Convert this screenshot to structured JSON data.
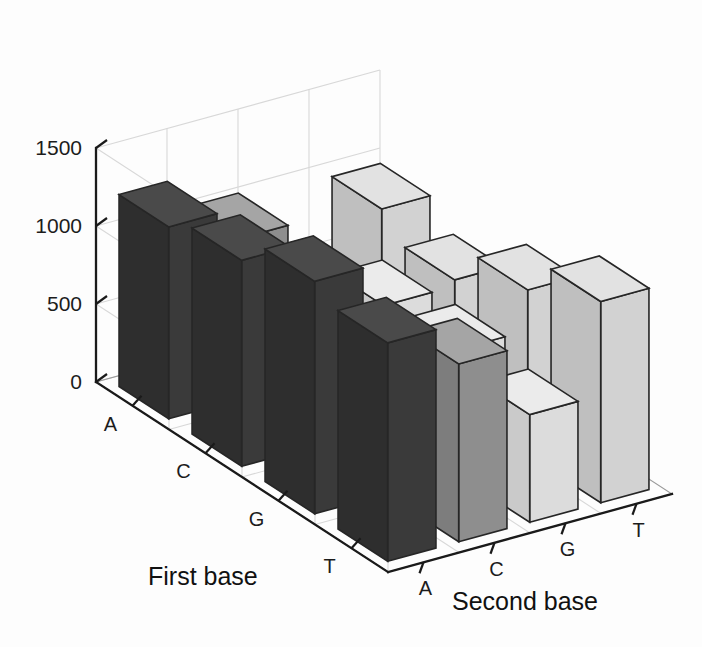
{
  "figure": {
    "background_color": "#fdfdfd",
    "axis_color": "#1a1a1a",
    "grid_color": "#d8d8d8"
  },
  "axes": {
    "value_axis": {
      "ticks": [
        "1500",
        "1000",
        "500",
        "0"
      ],
      "tick_values": [
        1500,
        1000,
        500,
        0
      ],
      "min": 0,
      "max": 1500
    },
    "row_axis": {
      "title": "First base",
      "categories": [
        "A",
        "C",
        "G",
        "T"
      ]
    },
    "column_axis": {
      "title": "Second base",
      "categories": [
        "A",
        "C",
        "G",
        "T"
      ]
    }
  },
  "series_colors": {
    "A": {
      "top": "#4a4a4a",
      "left": "#3a3a3a",
      "right": "#2e2e2e"
    },
    "C": {
      "top": "#a5a5a5",
      "left": "#8e8e8e",
      "right": "#7d7d7d"
    },
    "G": {
      "top": "#ebebeb",
      "left": "#dcdcdc",
      "right": "#cacaca"
    },
    "T": {
      "top": "#e2e2e2",
      "left": "#d2d2d2",
      "right": "#bfbfbf"
    }
  },
  "chart_data": {
    "type": "bar",
    "title": "",
    "subtitle": "",
    "xlabel": "Second base",
    "ylabel": "First base",
    "zlabel": "",
    "projection": "3d",
    "grid": true,
    "legend": "none",
    "ylim": [
      0,
      1500
    ],
    "zlim": [
      0,
      1500
    ],
    "categories": [
      "A",
      "C",
      "G",
      "T"
    ],
    "rows": [
      "A",
      "C",
      "G",
      "T"
    ],
    "columns": [
      "A",
      "C",
      "G",
      "T"
    ],
    "annotations": [],
    "series": [
      {
        "name": "A",
        "values": [
          1230,
          1320,
          1490,
          1400
        ]
      },
      {
        "name": "C",
        "values": [
          1030,
          960,
          720,
          1140
        ]
      },
      {
        "name": "G",
        "values": [
          620,
          780,
          800,
          690
        ]
      },
      {
        "name": "T",
        "values": [
          970,
          820,
          1060,
          1290
        ]
      }
    ],
    "matrix": [
      {
        "first_base": "A",
        "cells": [
          {
            "second_base": "A",
            "value": 1230
          },
          {
            "second_base": "C",
            "value": 1030
          },
          {
            "second_base": "G",
            "value": 620
          },
          {
            "second_base": "T",
            "value": 970
          }
        ]
      },
      {
        "first_base": "C",
        "cells": [
          {
            "second_base": "A",
            "value": 1320
          },
          {
            "second_base": "C",
            "value": 960
          },
          {
            "second_base": "G",
            "value": 780
          },
          {
            "second_base": "T",
            "value": 820
          }
        ]
      },
      {
        "first_base": "G",
        "cells": [
          {
            "second_base": "A",
            "value": 1490
          },
          {
            "second_base": "C",
            "value": 720
          },
          {
            "second_base": "G",
            "value": 800
          },
          {
            "second_base": "T",
            "value": 1060
          }
        ]
      },
      {
        "first_base": "T",
        "cells": [
          {
            "second_base": "A",
            "value": 1400
          },
          {
            "second_base": "C",
            "value": 1140
          },
          {
            "second_base": "G",
            "value": 690
          },
          {
            "second_base": "T",
            "value": 1290
          }
        ]
      }
    ]
  }
}
